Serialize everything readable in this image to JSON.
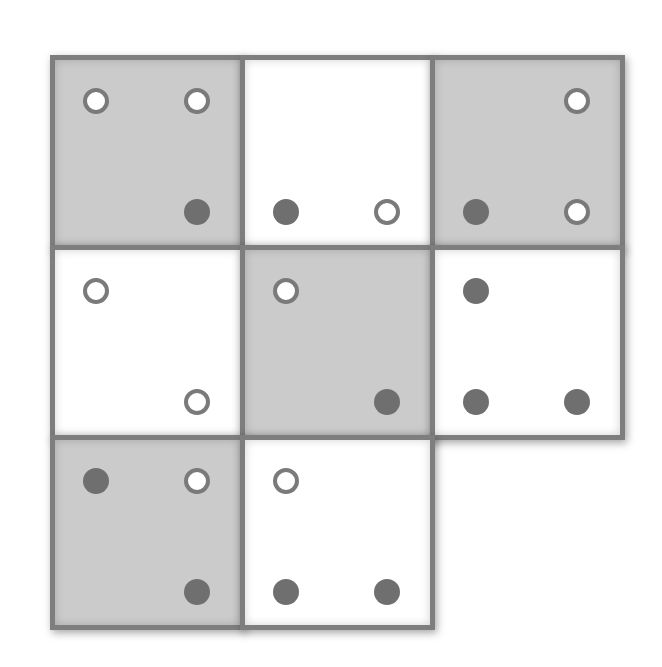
{
  "diagram": {
    "colors": {
      "tile_gray": "#cbcbcb",
      "tile_white": "#ffffff",
      "border": "#7e7e7e",
      "dot_filled": "#6f6f6f",
      "dot_hollow_ring": "#7a7a7a"
    },
    "tiles": [
      {
        "row": 0,
        "col": 0,
        "shade": "gray",
        "x": 50,
        "y": 55,
        "dots": [
          {
            "pos": "top-left",
            "type": "hollow"
          },
          {
            "pos": "top-right",
            "type": "hollow"
          },
          {
            "pos": "bottom-right",
            "type": "filled"
          }
        ]
      },
      {
        "row": 0,
        "col": 1,
        "shade": "white",
        "x": 240,
        "y": 55,
        "dots": [
          {
            "pos": "bottom-left",
            "type": "filled"
          },
          {
            "pos": "bottom-right",
            "type": "hollow"
          }
        ]
      },
      {
        "row": 0,
        "col": 2,
        "shade": "gray",
        "x": 430,
        "y": 55,
        "dots": [
          {
            "pos": "top-right",
            "type": "hollow"
          },
          {
            "pos": "bottom-left",
            "type": "filled"
          },
          {
            "pos": "bottom-right",
            "type": "hollow"
          }
        ]
      },
      {
        "row": 1,
        "col": 0,
        "shade": "white",
        "x": 50,
        "y": 245,
        "dots": [
          {
            "pos": "top-left",
            "type": "hollow"
          },
          {
            "pos": "bottom-right",
            "type": "hollow"
          }
        ]
      },
      {
        "row": 1,
        "col": 1,
        "shade": "gray",
        "x": 240,
        "y": 245,
        "dots": [
          {
            "pos": "top-left",
            "type": "hollow"
          },
          {
            "pos": "bottom-right",
            "type": "filled"
          }
        ]
      },
      {
        "row": 1,
        "col": 2,
        "shade": "white",
        "x": 430,
        "y": 245,
        "dots": [
          {
            "pos": "top-left",
            "type": "filled"
          },
          {
            "pos": "bottom-left",
            "type": "filled"
          },
          {
            "pos": "bottom-right",
            "type": "filled"
          }
        ]
      },
      {
        "row": 2,
        "col": 0,
        "shade": "gray",
        "x": 50,
        "y": 435,
        "dots": [
          {
            "pos": "top-left",
            "type": "filled"
          },
          {
            "pos": "top-right",
            "type": "hollow"
          },
          {
            "pos": "bottom-right",
            "type": "filled"
          }
        ]
      },
      {
        "row": 2,
        "col": 1,
        "shade": "white",
        "x": 240,
        "y": 435,
        "dots": [
          {
            "pos": "top-left",
            "type": "hollow"
          },
          {
            "pos": "bottom-left",
            "type": "filled"
          },
          {
            "pos": "bottom-right",
            "type": "filled"
          }
        ]
      }
    ],
    "empty_cell": {
      "row": 2,
      "col": 2
    }
  }
}
